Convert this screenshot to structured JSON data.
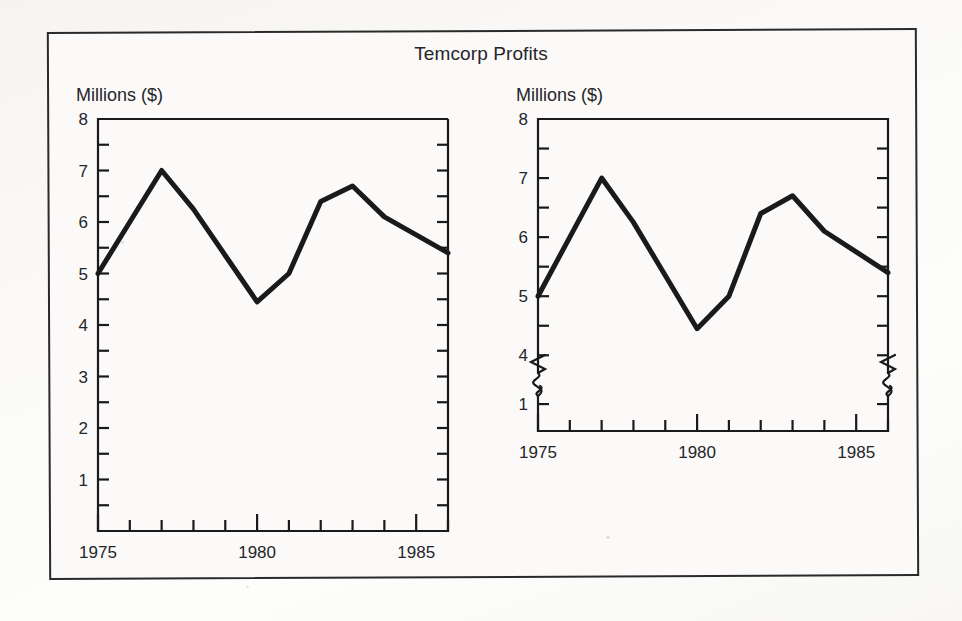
{
  "figure": {
    "title": "Temcorp Profits",
    "background_color": "#fbfaf8",
    "frame_color": "#2a2a2c",
    "line_color": "#1a1a1c",
    "text_color": "#25252a"
  },
  "chart_data": [
    {
      "id": "left-chart",
      "type": "line",
      "title": "Temcorp Profits",
      "ylabel": "Millions ($)",
      "xlabel": "",
      "axis_break": false,
      "grid": false,
      "legend": "none",
      "ylim": [
        0,
        8
      ],
      "xlim": [
        1975,
        1986
      ],
      "y_major_ticks": [
        1,
        2,
        3,
        4,
        5,
        6,
        7,
        8
      ],
      "y_tick_labels": [
        "1",
        "2",
        "3",
        "4",
        "5",
        "6",
        "7",
        "8"
      ],
      "y_minor_tick_step": 0.5,
      "x_ticks": [
        1975,
        1976,
        1977,
        1978,
        1979,
        1980,
        1981,
        1982,
        1983,
        1984,
        1985,
        1986
      ],
      "x_tick_labels_shown": [
        "1975",
        "1980",
        "1985"
      ],
      "x_labeled_values": [
        1975,
        1980,
        1985
      ],
      "x": [
        1975,
        1976,
        1977,
        1978,
        1979,
        1980,
        1981,
        1982,
        1983,
        1984,
        1985,
        1986
      ],
      "values": [
        5.0,
        6.0,
        7.0,
        6.25,
        5.35,
        4.45,
        5.0,
        6.4,
        6.7,
        6.1,
        5.75,
        5.4
      ]
    },
    {
      "id": "right-chart",
      "type": "line",
      "title": "Temcorp Profits",
      "ylabel": "Millions ($)",
      "xlabel": "",
      "axis_break": true,
      "axis_break_note": "y-axis truncated between 1 and 4",
      "grid": false,
      "legend": "none",
      "ylim": [
        3.7,
        8
      ],
      "ylim_lower_stub": [
        0,
        1.3
      ],
      "xlim": [
        1975,
        1986
      ],
      "y_major_ticks": [
        4,
        5,
        6,
        7,
        8
      ],
      "y_tick_labels": [
        "4",
        "5",
        "6",
        "7",
        "8"
      ],
      "y_stub_tick_labels": [
        "1"
      ],
      "y_minor_tick_step": 0.5,
      "x_ticks": [
        1975,
        1976,
        1977,
        1978,
        1979,
        1980,
        1981,
        1982,
        1983,
        1984,
        1985,
        1986
      ],
      "x_tick_labels_shown": [
        "1975",
        "1980",
        "1985"
      ],
      "x_labeled_values": [
        1975,
        1980,
        1985
      ],
      "x": [
        1975,
        1976,
        1977,
        1978,
        1979,
        1980,
        1981,
        1982,
        1983,
        1984,
        1985,
        1986
      ],
      "values": [
        5.0,
        6.0,
        7.0,
        6.25,
        5.35,
        4.45,
        5.0,
        6.4,
        6.7,
        6.1,
        5.75,
        5.4
      ]
    }
  ]
}
